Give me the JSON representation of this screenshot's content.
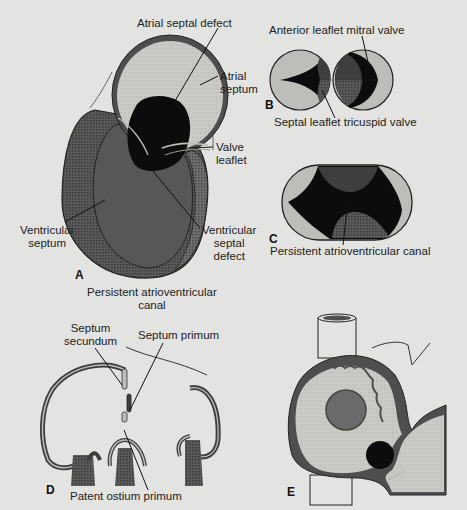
{
  "figure": {
    "background": "#e3e3e1",
    "colors": {
      "wall_dark": "#4e4e4e",
      "wall_pattern": "#6a6a6a",
      "atrium_light": "#c9c9c6",
      "ventricle": "#575757",
      "defect_black": "#0c0c0c",
      "valve_light": "#bdbdba",
      "leaflet_mid": "#3e3e3e"
    },
    "panels": [
      {
        "id": "A",
        "letter": "A",
        "caption": [
          "Persistent atrioventricular",
          "canal"
        ],
        "labels": {
          "atrial_septal_defect": "Atrial septal defect",
          "atrial_septum": [
            "Atrial",
            "septum"
          ],
          "valve_leaflet": [
            "Valve",
            "leaflet"
          ],
          "ventricular_septum": [
            "Ventricular",
            "septum"
          ],
          "ventricular_septal_defect": [
            "Ventricular",
            "septal",
            "defect"
          ]
        }
      },
      {
        "id": "B",
        "letter": "B",
        "labels": {
          "anterior_leaflet": "Anterior leaflet mitral valve",
          "septal_leaflet": "Septal leaflet tricuspid valve"
        }
      },
      {
        "id": "C",
        "letter": "C",
        "labels": {
          "canal": "Persistent atrioventricular canal"
        }
      },
      {
        "id": "D",
        "letter": "D",
        "labels": {
          "septum_secundum": [
            "Septum",
            "secundum"
          ],
          "septum_primum": "Septum primum",
          "patent_ostium_primum": "Patent ostium primum"
        }
      },
      {
        "id": "E",
        "letter": "E"
      }
    ]
  }
}
